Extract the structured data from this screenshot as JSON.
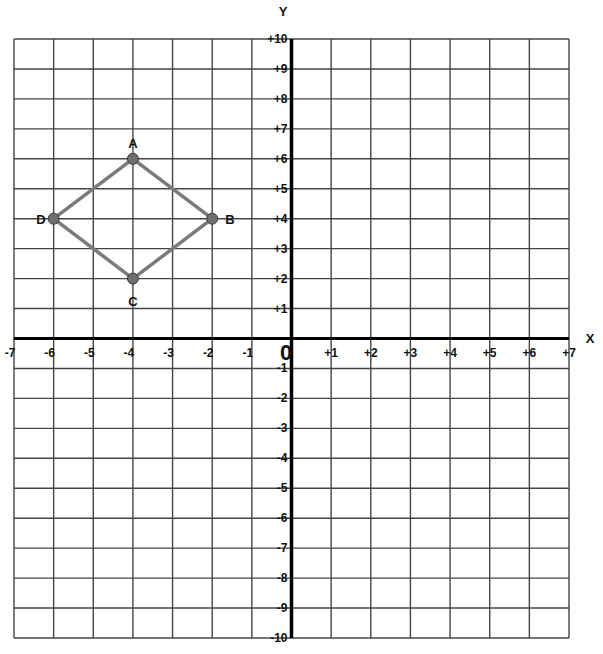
{
  "chart_data": {
    "type": "scatter",
    "title": "",
    "xlabel": "X",
    "ylabel": "Y",
    "xlim": [
      -7,
      7
    ],
    "ylim": [
      -10,
      10
    ],
    "grid": true,
    "origin_label": "0",
    "x_ticks": [
      {
        "value": -7,
        "label": "-7"
      },
      {
        "value": -6,
        "label": "-6"
      },
      {
        "value": -5,
        "label": "-5"
      },
      {
        "value": -4,
        "label": "-4"
      },
      {
        "value": -3,
        "label": "-3"
      },
      {
        "value": -2,
        "label": "-2"
      },
      {
        "value": -1,
        "label": "-1"
      },
      {
        "value": 1,
        "label": "+1"
      },
      {
        "value": 2,
        "label": "+2"
      },
      {
        "value": 3,
        "label": "+3"
      },
      {
        "value": 4,
        "label": "+4"
      },
      {
        "value": 5,
        "label": "+5"
      },
      {
        "value": 6,
        "label": "+6"
      },
      {
        "value": 7,
        "label": "+7"
      }
    ],
    "y_ticks": [
      {
        "value": 10,
        "label": "+10"
      },
      {
        "value": 9,
        "label": "+9"
      },
      {
        "value": 8,
        "label": "+8"
      },
      {
        "value": 7,
        "label": "+7"
      },
      {
        "value": 6,
        "label": "+6"
      },
      {
        "value": 5,
        "label": "+5"
      },
      {
        "value": 4,
        "label": "+4"
      },
      {
        "value": 3,
        "label": "+3"
      },
      {
        "value": 2,
        "label": "+2"
      },
      {
        "value": 1,
        "label": "+1"
      },
      {
        "value": -1,
        "label": "-1"
      },
      {
        "value": -2,
        "label": "-2"
      },
      {
        "value": -3,
        "label": "-3"
      },
      {
        "value": -4,
        "label": "-4"
      },
      {
        "value": -5,
        "label": "-5"
      },
      {
        "value": -6,
        "label": "-6"
      },
      {
        "value": -7,
        "label": "-7"
      },
      {
        "value": -8,
        "label": "-8"
      },
      {
        "value": -9,
        "label": "-9"
      },
      {
        "value": -10,
        "label": "-10"
      }
    ],
    "points": [
      {
        "name": "A",
        "x": -4,
        "y": 6,
        "label_pos": "above"
      },
      {
        "name": "B",
        "x": -2,
        "y": 4,
        "label_pos": "right"
      },
      {
        "name": "C",
        "x": -4,
        "y": 2,
        "label_pos": "below"
      },
      {
        "name": "D",
        "x": -6,
        "y": 4,
        "label_pos": "left"
      }
    ],
    "polygon": [
      "A",
      "B",
      "C",
      "D"
    ],
    "colors": {
      "grid": "#444444",
      "axis": "#000000",
      "shape_stroke": "#7a7a7a",
      "point_fill": "#6e6e6e",
      "point_stroke": "#3a3a3a"
    }
  }
}
